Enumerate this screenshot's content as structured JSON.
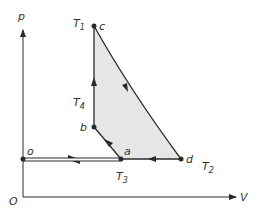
{
  "diagram": {
    "type": "p-V cycle diagram",
    "axes": {
      "y_label": "p",
      "x_label": "V",
      "origin_label": "O"
    },
    "points": [
      {
        "id": "o",
        "label": "o"
      },
      {
        "id": "a",
        "label": "a"
      },
      {
        "id": "b",
        "label": "b"
      },
      {
        "id": "c",
        "label": "c"
      },
      {
        "id": "d",
        "label": "d"
      }
    ],
    "temperatures": {
      "T1": {
        "base": "T",
        "sub": "1"
      },
      "T2": {
        "base": "T",
        "sub": "2"
      },
      "T3": {
        "base": "T",
        "sub": "3"
      },
      "T4": {
        "base": "T",
        "sub": "4"
      }
    },
    "colors": {
      "line": "#2a2a2a",
      "fill": "#e6e6e6",
      "text": "#333333"
    }
  }
}
